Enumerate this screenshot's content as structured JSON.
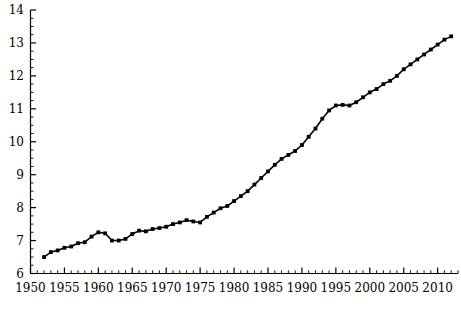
{
  "chart_data": {
    "type": "line",
    "title": "",
    "subtitle": "",
    "xlabel": "",
    "ylabel": "",
    "xlim": [
      1950,
      2013
    ],
    "ylim": [
      6,
      14
    ],
    "grid": false,
    "legend": null,
    "axis_color": "#000000",
    "line_color": "#000000",
    "marker_color": "#000000",
    "marker": "square",
    "x_ticks_major": [
      1950,
      1955,
      1960,
      1965,
      1970,
      1975,
      1980,
      1985,
      1990,
      1995,
      2000,
      2005,
      2010
    ],
    "x_tick_labels": [
      "1950",
      "1955",
      "1960",
      "1965",
      "1970",
      "1975",
      "1980",
      "1985",
      "1990",
      "1995",
      "2000",
      "2005",
      "2010"
    ],
    "x_minor_step": 1,
    "y_ticks_major": [
      6,
      7,
      8,
      9,
      10,
      11,
      12,
      13,
      14
    ],
    "y_tick_labels": [
      "6",
      "7",
      "8",
      "9",
      "10",
      "11",
      "12",
      "13",
      "14"
    ],
    "y_minor_step": 0.25,
    "x": [
      1952,
      1953,
      1954,
      1955,
      1956,
      1957,
      1958,
      1959,
      1960,
      1961,
      1962,
      1963,
      1964,
      1965,
      1966,
      1967,
      1968,
      1969,
      1970,
      1971,
      1972,
      1973,
      1974,
      1975,
      1976,
      1977,
      1978,
      1979,
      1980,
      1981,
      1982,
      1983,
      1984,
      1985,
      1986,
      1987,
      1988,
      1989,
      1990,
      1991,
      1992,
      1993,
      1994,
      1995,
      1996,
      1997,
      1998,
      1999,
      2000,
      2001,
      2002,
      2003,
      2004,
      2005,
      2006,
      2007,
      2008,
      2009,
      2010,
      2011,
      2012
    ],
    "values": [
      6.5,
      6.65,
      6.7,
      6.78,
      6.82,
      6.92,
      6.95,
      7.12,
      7.25,
      7.22,
      7.0,
      7.0,
      7.05,
      7.2,
      7.3,
      7.28,
      7.35,
      7.38,
      7.42,
      7.5,
      7.55,
      7.62,
      7.58,
      7.55,
      7.72,
      7.85,
      7.98,
      8.05,
      8.2,
      8.35,
      8.5,
      8.7,
      8.9,
      9.1,
      9.3,
      9.48,
      9.6,
      9.72,
      9.9,
      10.15,
      10.4,
      10.7,
      10.95,
      11.1,
      11.12,
      11.1,
      11.2,
      11.35,
      11.5,
      11.6,
      11.75,
      11.85,
      12.0,
      12.2,
      12.35,
      12.5,
      12.65,
      12.8,
      12.95,
      13.1,
      13.2
    ],
    "series": [
      {
        "name": "series-1",
        "values": [
          6.5,
          6.65,
          6.7,
          6.78,
          6.82,
          6.92,
          6.95,
          7.12,
          7.25,
          7.22,
          7.0,
          7.0,
          7.05,
          7.2,
          7.3,
          7.28,
          7.35,
          7.38,
          7.42,
          7.5,
          7.55,
          7.62,
          7.58,
          7.55,
          7.72,
          7.85,
          7.98,
          8.05,
          8.2,
          8.35,
          8.5,
          8.7,
          8.9,
          9.1,
          9.3,
          9.48,
          9.6,
          9.72,
          9.9,
          10.15,
          10.4,
          10.7,
          10.95,
          11.1,
          11.12,
          11.1,
          11.2,
          11.35,
          11.5,
          11.6,
          11.75,
          11.85,
          12.0,
          12.2,
          12.35,
          12.5,
          12.65,
          12.8,
          12.95,
          13.1,
          13.2
        ]
      }
    ]
  }
}
